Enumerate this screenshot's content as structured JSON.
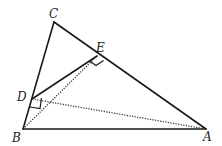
{
  "diagram": {
    "type": "geometry",
    "points": {
      "A": {
        "label": "A",
        "x": 206,
        "y": 129
      },
      "B": {
        "label": "B",
        "x": 23,
        "y": 129
      },
      "C": {
        "label": "C",
        "x": 54,
        "y": 22
      },
      "D": {
        "label": "D",
        "x": 32,
        "y": 99
      },
      "E": {
        "label": "E",
        "x": 97,
        "y": 56
      }
    },
    "segments": [
      {
        "from": "C",
        "to": "B",
        "style": "solid"
      },
      {
        "from": "C",
        "to": "A",
        "style": "solid"
      },
      {
        "from": "B",
        "to": "A",
        "style": "solid"
      },
      {
        "from": "D",
        "to": "E",
        "style": "solid"
      },
      {
        "from": "D",
        "to": "A",
        "style": "dotted"
      },
      {
        "from": "B",
        "to": "E",
        "style": "dotted"
      }
    ],
    "right_angles": [
      "E",
      "D"
    ],
    "labels": {
      "A": "A",
      "B": "B",
      "C": "C",
      "D": "D",
      "E": "E"
    }
  }
}
